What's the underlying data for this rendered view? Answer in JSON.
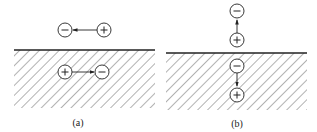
{
  "diagram": {
    "panels": [
      {
        "id": "a",
        "label": "(a)",
        "orientation": "horizontal",
        "above_surface": {
          "left_charge": "−",
          "right_charge": "+",
          "arrow": "points from + toward −"
        },
        "below_surface": {
          "left_charge": "+",
          "right_charge": "−",
          "arrow": "points from + toward −"
        }
      },
      {
        "id": "b",
        "label": "(b)",
        "orientation": "vertical",
        "above_surface": {
          "top_charge": "−",
          "bottom_charge": "+",
          "arrow": "points from + up toward −"
        },
        "below_surface": {
          "top_charge": "−",
          "bottom_charge": "+",
          "arrow": "points from − down toward +"
        }
      }
    ],
    "colors": {
      "ink": "#222222",
      "hatch": "#555555",
      "background": "#ffffff"
    }
  }
}
